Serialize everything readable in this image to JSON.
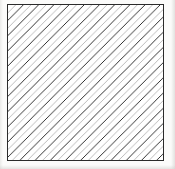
{
  "figure": {
    "kind": "hatch-pattern-swatch",
    "canvas": {
      "width_px": 175,
      "height_px": 169,
      "background_color": "#fbfbfa"
    },
    "box": {
      "label": "hatched-square",
      "left_px": 7,
      "top_px": 4,
      "width_px": 157,
      "height_px": 157,
      "fill_color": "#ffffff",
      "border_color": "#2b2b2b",
      "border_width_px": 1
    },
    "hatch": {
      "direction": "top-left-to-bottom-right",
      "glyph": "\\",
      "angle_deg": 45,
      "spacing_px": 7.6,
      "line_width_px": 1.3,
      "dark_line_color": "#262626",
      "light_line_color": "#b9b9b9",
      "alternating": true,
      "line_count": 41
    }
  }
}
